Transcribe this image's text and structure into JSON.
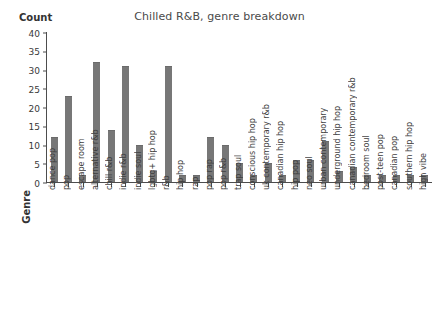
{
  "chart_data": {
    "type": "bar",
    "title": "Chilled R&B, genre breakdown",
    "xlabel": "Genre",
    "ylabel": "Count",
    "ylim": [
      0,
      40
    ],
    "yticks": [
      0,
      5,
      10,
      15,
      20,
      25,
      30,
      35,
      40
    ],
    "grid": false,
    "legend": false,
    "bar_color": "#777777",
    "categories": [
      "dance pop",
      "pop",
      "escape room",
      "alternative r&b",
      "chill r&b",
      "indie r&b",
      "indie soul",
      "lgbtq+ hip hop",
      "r&b",
      "hip hop",
      "rap",
      "pop rap",
      "pop r&b",
      "trap soul",
      "conscious hip hop",
      "uk contemporary r&b",
      "canadian hip hop",
      "hip pop",
      "neo soul",
      "urban contemporary",
      "underground hip hop",
      "canadian contemporary r&b",
      "bedroom soul",
      "post-teen pop",
      "canadian pop",
      "southern hip hop",
      "high vibe"
    ],
    "values": [
      12,
      23,
      2,
      32,
      14,
      31,
      10,
      3,
      31,
      2,
      2,
      12,
      10,
      5,
      2,
      5,
      2,
      6,
      6,
      11,
      3,
      4,
      2,
      2,
      2,
      2,
      2
    ]
  }
}
